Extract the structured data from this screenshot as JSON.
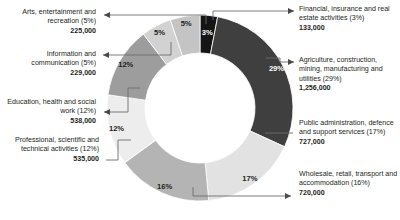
{
  "chart_data": {
    "type": "pie",
    "variant": "donut",
    "title": "",
    "xlabel": "",
    "ylabel": "",
    "legend_position": "callout-labels",
    "grid": false,
    "total": 4363000,
    "categories": [
      "Financial, insurance and real estate activities",
      "Agriculture, construction, mining, manufacturing and utilities",
      "Public administration, defence and support services",
      "Wholesale, retail, transport and accommodation",
      "Professional, scientific and technical activities",
      "Education, health and social work",
      "Information and communication",
      "Arts, entertainment and recreation"
    ],
    "values": [
      133000,
      1256000,
      727000,
      720000,
      535000,
      538000,
      229000,
      225000
    ],
    "percents": [
      3,
      29,
      17,
      16,
      12,
      12,
      5,
      5
    ],
    "value_labels": [
      "133,000",
      "1,256,000",
      "727,000",
      "720,000",
      "535,000",
      "538,000",
      "229,000",
      "225,000"
    ],
    "percent_labels": [
      "3%",
      "29%",
      "17%",
      "16%",
      "12%",
      "12%",
      "5%",
      "5%"
    ],
    "colors": [
      "#151515",
      "#3f3f3f",
      "#e2e2e2",
      "#b4b4b4",
      "#ededed",
      "#9d9d9d",
      "#d2d2d2",
      "#c4c4c4"
    ]
  },
  "callouts": {
    "left": [
      {
        "name": "Arts, entertainment and recreation (5%)",
        "value": "225,000"
      },
      {
        "name": "Information and communication (5%)",
        "value": "229,000"
      },
      {
        "name": "Education, health and social work (12%)",
        "value": "538,000"
      },
      {
        "name": "Professional, scientific and technical activities (12%)",
        "value": "535,000"
      }
    ],
    "right": [
      {
        "name": "Financial, insurance and real estate activities (3%)",
        "value": "133,000"
      },
      {
        "name": "Agriculture, construction, mining, manufacturing and utilities (29%)",
        "value": "1,256,000"
      },
      {
        "name": "Public administration, defence and support services (17%)",
        "value": "727,000"
      },
      {
        "name": "Wholesale, retail, transport and accommodation (16%)",
        "value": "720,000"
      }
    ]
  },
  "slice_labels": {
    "s0": "3%",
    "s1": "29%",
    "s2": "17%",
    "s3": "16%",
    "s4": "12%",
    "s5": "12%",
    "s6": "5%",
    "s7": "5%"
  }
}
